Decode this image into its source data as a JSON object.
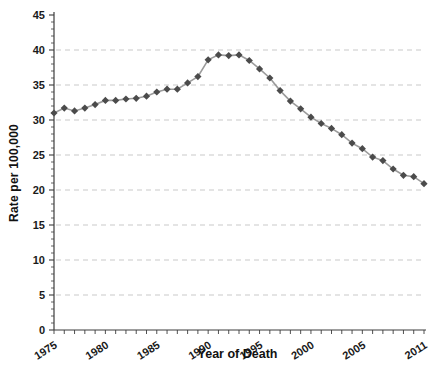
{
  "chart_data": {
    "type": "line",
    "title": "",
    "xlabel": "Year of Death",
    "ylabel": "Rate per 100,000",
    "x": [
      1975,
      1976,
      1977,
      1978,
      1979,
      1980,
      1981,
      1982,
      1983,
      1984,
      1985,
      1986,
      1987,
      1988,
      1989,
      1990,
      1991,
      1992,
      1993,
      1994,
      1995,
      1996,
      1997,
      1998,
      1999,
      2000,
      2001,
      2002,
      2003,
      2004,
      2005,
      2006,
      2007,
      2008,
      2009,
      2010,
      2011
    ],
    "series": [
      {
        "name": "Rate per 100,000",
        "values": [
          31.0,
          31.7,
          31.3,
          31.7,
          32.2,
          32.8,
          32.8,
          33.0,
          33.1,
          33.4,
          34.0,
          34.4,
          34.4,
          35.3,
          36.2,
          38.6,
          39.3,
          39.2,
          39.3,
          38.5,
          37.3,
          36.0,
          34.2,
          32.7,
          31.6,
          30.4,
          29.5,
          28.8,
          27.9,
          26.7,
          25.9,
          24.7,
          24.2,
          23.0,
          22.1,
          21.9,
          20.9
        ]
      }
    ],
    "xlim": [
      1975,
      2011
    ],
    "ylim": [
      0,
      45
    ],
    "ytick_step": 5,
    "xticks": [
      1975,
      1980,
      1985,
      1990,
      1995,
      2000,
      2005,
      2011
    ],
    "grid": "horizontal-dashed",
    "legend": "none",
    "marker": "diamond",
    "colors": {
      "line": "#9b9b9b",
      "marker": "#4b4b4b",
      "grid": "#c9c9c9",
      "axis": "#3d3d3d",
      "text": "#1a1a1a"
    }
  }
}
